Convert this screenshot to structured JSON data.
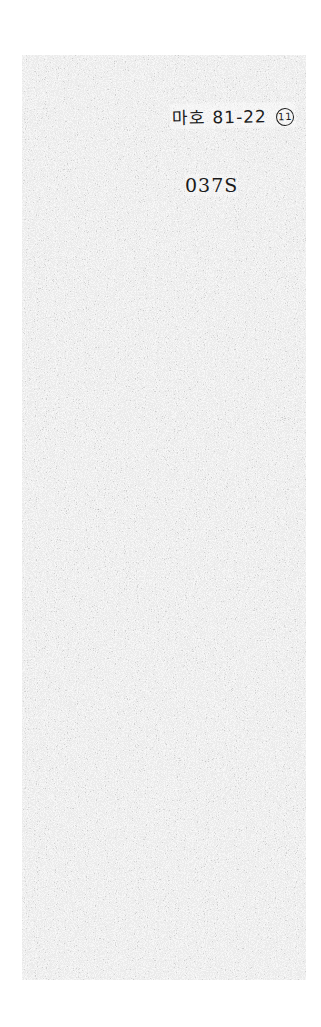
{
  "document": {
    "type": "scanned-page",
    "background_color": "#e9e9e9",
    "ink_color": "#1a1a1a",
    "handwritten_label": {
      "text": "마호 81-22",
      "circled_number": "11"
    },
    "top_number": "037S",
    "bottom_page_number": "0348"
  }
}
